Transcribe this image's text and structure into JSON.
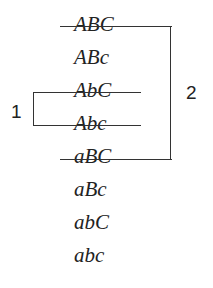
{
  "diagram": {
    "rows": [
      {
        "text": "ABC",
        "struck": true
      },
      {
        "text": "ABc",
        "struck": false
      },
      {
        "text": "AbC",
        "struck": true
      },
      {
        "text": "Abc",
        "struck": true
      },
      {
        "text": "aBC",
        "struck": true
      },
      {
        "text": "aBc",
        "struck": false
      },
      {
        "text": "abC",
        "struck": false
      },
      {
        "text": "abc",
        "struck": false
      }
    ],
    "brackets": [
      {
        "label": "1",
        "side": "left",
        "from_row": "AbC",
        "to_row": "Abc"
      },
      {
        "label": "2",
        "side": "right",
        "from_row": "ABC",
        "to_row": "aBC"
      }
    ]
  }
}
